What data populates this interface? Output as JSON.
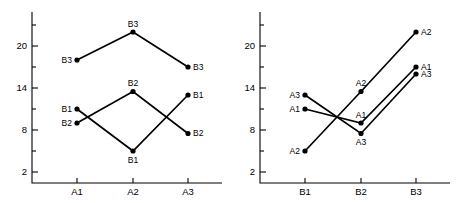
{
  "figure": {
    "type": "interaction-plot-pair",
    "background_color": "#ffffff",
    "ink_color": "#000000"
  },
  "chart_data": [
    {
      "type": "line",
      "panel": "left",
      "title": "",
      "xlabel": "",
      "ylabel": "",
      "categories": [
        "A1",
        "A2",
        "A3"
      ],
      "xtick_labels": [
        "A1",
        "A2",
        "A3"
      ],
      "ytick_labels": [
        "2",
        "8",
        "14",
        "20"
      ],
      "ytick_values": [
        2,
        8,
        14,
        20
      ],
      "yminor_values": [
        5,
        11,
        17,
        23
      ],
      "ylim": [
        0,
        23.5
      ],
      "grid": false,
      "legend": "none",
      "point_labels_shown": true,
      "series": [
        {
          "name": "B1",
          "values": [
            11,
            5,
            13
          ],
          "labels": [
            "B1",
            "B1",
            "B1"
          ],
          "label_positions": [
            "left",
            "below",
            "right"
          ]
        },
        {
          "name": "B2",
          "values": [
            9,
            13.5,
            7.5
          ],
          "labels": [
            "B2",
            "B2",
            "B2"
          ],
          "label_positions": [
            "left",
            "above",
            "right"
          ]
        },
        {
          "name": "B3",
          "values": [
            18,
            22,
            17
          ],
          "labels": [
            "B3",
            "B3",
            "B3"
          ],
          "label_positions": [
            "left",
            "above",
            "right"
          ]
        }
      ]
    },
    {
      "type": "line",
      "panel": "right",
      "title": "",
      "xlabel": "",
      "ylabel": "",
      "categories": [
        "B1",
        "B2",
        "B3"
      ],
      "xtick_labels": [
        "B1",
        "B2",
        "B3"
      ],
      "ytick_labels": [
        "2",
        "8",
        "14",
        "20"
      ],
      "ytick_values": [
        2,
        8,
        14,
        20
      ],
      "yminor_values": [
        5,
        11,
        17,
        23
      ],
      "ylim": [
        0,
        23.5
      ],
      "grid": false,
      "legend": "none",
      "point_labels_shown": true,
      "series": [
        {
          "name": "A1",
          "values": [
            11,
            9,
            17
          ],
          "labels": [
            "A1",
            "A1",
            "A1"
          ],
          "label_positions": [
            "left",
            "above",
            "right"
          ]
        },
        {
          "name": "A2",
          "values": [
            5,
            13.5,
            22
          ],
          "labels": [
            "A2",
            "A2",
            "A2"
          ],
          "label_positions": [
            "left",
            "above",
            "right"
          ]
        },
        {
          "name": "A3",
          "values": [
            13,
            7.5,
            16
          ],
          "labels": [
            "A3",
            "A3",
            "A3"
          ],
          "label_positions": [
            "left",
            "below",
            "right"
          ]
        }
      ]
    }
  ]
}
